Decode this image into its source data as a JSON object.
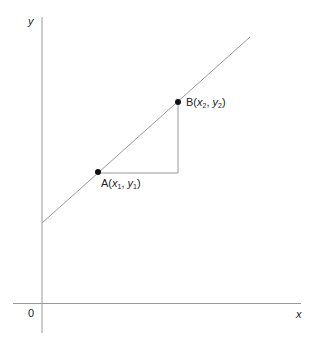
{
  "diagram": {
    "axes": {
      "x_label": "x",
      "y_label": "y",
      "origin_label": "0",
      "stroke_color": "#9a9a9a"
    },
    "line": {
      "stroke_color": "#9a9a9a",
      "start": [
        42,
        223
      ],
      "end": [
        250,
        37
      ]
    },
    "points": [
      {
        "name": "A",
        "letter": "A",
        "x_var": "x",
        "x_sub": "1",
        "y_var": "y",
        "y_sub": "1",
        "px": [
          98,
          172
        ]
      },
      {
        "name": "B",
        "letter": "B",
        "x_var": "x",
        "x_sub": "2",
        "y_var": "y",
        "y_sub": "2",
        "px": [
          178,
          102
        ]
      }
    ],
    "triangle": {
      "stroke_color": "#9a9a9a",
      "corner": [
        178,
        173
      ]
    },
    "point_color": "#111111"
  }
}
